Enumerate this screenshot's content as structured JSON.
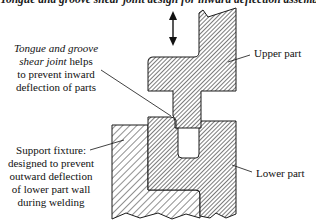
{
  "title": "Tongue and groove shear joint design for inward deflection assembly",
  "labels": {
    "joint_italic_line1": "Tongue and groove",
    "joint_italic_line2": "shear joint",
    "joint_line2_rest": " helps",
    "joint_line3": "to prevent inward",
    "joint_line4": "deflection of parts",
    "upper_part": "Upper part",
    "lower_part": "Lower part",
    "fixture_line1": "Support fixture:",
    "fixture_line2": "designed to prevent",
    "fixture_line3": "outward deflection",
    "fixture_line4": "of lower part wall",
    "fixture_line5": "during welding"
  },
  "colors": {
    "outline": "#1a1a1a",
    "hatch_fine": "#333333",
    "hatch_coarse": "#222222",
    "background": "#ffffff"
  },
  "icons": {
    "motion_arrow": "double-vertical-arrow"
  }
}
